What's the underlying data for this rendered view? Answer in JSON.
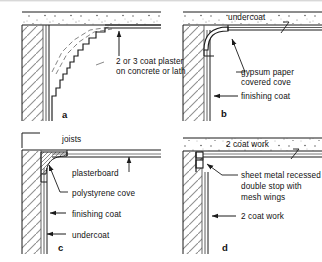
{
  "figure": {
    "width": 322,
    "height": 262,
    "background_color": "#ffffff",
    "line_color": "#1a1a1a",
    "hatch_color": "#9a9a9a",
    "speckle_color": "#555555"
  },
  "panels": [
    {
      "id": "a",
      "letter": "a",
      "position": "top-left",
      "labels": [
        {
          "name": "plaster-note",
          "line1": "2 or 3 coat plaster",
          "line2": "on concrete or lath"
        }
      ]
    },
    {
      "id": "b",
      "letter": "b",
      "position": "top-right",
      "labels": [
        {
          "name": "undercoat",
          "line1": "undercoat",
          "line2": ""
        },
        {
          "name": "gypsum-cove",
          "line1": "gypsum paper",
          "line2": "covered cove"
        },
        {
          "name": "finishing-coat",
          "line1": "finishing coat",
          "line2": ""
        }
      ]
    },
    {
      "id": "c",
      "letter": "c",
      "position": "bottom-left",
      "labels": [
        {
          "name": "joists",
          "line1": "joists",
          "line2": ""
        },
        {
          "name": "plasterboard",
          "line1": "plasterboard",
          "line2": ""
        },
        {
          "name": "polystyrene-cove",
          "line1": "polystyrene cove",
          "line2": ""
        },
        {
          "name": "finishing-coat",
          "line1": "finishing coat",
          "line2": ""
        },
        {
          "name": "undercoat",
          "line1": "undercoat",
          "line2": ""
        }
      ]
    },
    {
      "id": "d",
      "letter": "d",
      "position": "bottom-right",
      "labels": [
        {
          "name": "two-coat-work-ceiling",
          "line1": "2 coat work",
          "line2": ""
        },
        {
          "name": "sheet-metal-stop",
          "line1": "sheet metal recessed",
          "line2": "double stop with",
          "line3": "mesh wings"
        },
        {
          "name": "two-coat-work-wall",
          "line1": "2 coat work",
          "line2": ""
        }
      ]
    }
  ],
  "text": {
    "a_plaster_1": "2 or 3 coat plaster",
    "a_plaster_2": "on concrete or lath",
    "a_letter": "a",
    "b_undercoat": "undercoat",
    "b_gypsum_1": "gypsum paper",
    "b_gypsum_2": "covered cove",
    "b_finishing": "finishing coat",
    "b_letter": "b",
    "c_joists": "joists",
    "c_plasterboard": "plasterboard",
    "c_polystyrene": "polystyrene cove",
    "c_finishing": "finishing coat",
    "c_undercoat": "undercoat",
    "c_letter": "c",
    "d_twocoat_top": "2 coat work",
    "d_sheet_1": "sheet metal recessed",
    "d_sheet_2": "double stop with",
    "d_sheet_3": "mesh wings",
    "d_twocoat_bottom": "2 coat work",
    "d_letter": "d"
  }
}
